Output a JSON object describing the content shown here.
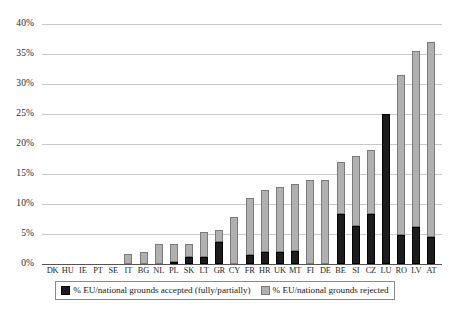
{
  "chart_data": {
    "type": "bar",
    "stacked": true,
    "title": "",
    "subtitle": "",
    "xlabel": "",
    "ylabel": "",
    "ylim": [
      0,
      40
    ],
    "ytick_step": 5,
    "ytick_labels": [
      "0%",
      "5%",
      "10%",
      "15%",
      "20%",
      "25%",
      "30%",
      "35%",
      "40%"
    ],
    "ytick_values": [
      0,
      5,
      10,
      15,
      20,
      25,
      30,
      35,
      40
    ],
    "grid": true,
    "legend_position": "bottom",
    "categories": [
      "DK",
      "HU",
      "IE",
      "PT",
      "SE",
      "IT",
      "BG",
      "NL",
      "PL",
      "SK",
      "LT",
      "GR",
      "CY",
      "FR",
      "HR",
      "UK",
      "MT",
      "FI",
      "DE",
      "BE",
      "SI",
      "CZ",
      "LU",
      "RO",
      "LV",
      "AT"
    ],
    "series": [
      {
        "name": "% EU/national grounds accepted (fully/partially)",
        "color": "#1c1c1c",
        "values": [
          0,
          0,
          0,
          0,
          0,
          0,
          0,
          0,
          0.4,
          1.1,
          1.2,
          3.7,
          0,
          1.5,
          2.0,
          2.0,
          2.1,
          0,
          0,
          8.3,
          6.3,
          8.3,
          25.0,
          4.8,
          6.2,
          4.5
        ]
      },
      {
        "name": "% EU/national grounds rejected",
        "color": "#b0b0b0",
        "values": [
          0,
          0,
          0,
          0,
          0,
          1.7,
          2.0,
          3.3,
          2.9,
          2.3,
          4.2,
          2.0,
          7.8,
          9.5,
          10.4,
          10.8,
          11.2,
          14.0,
          14.0,
          8.7,
          11.7,
          10.7,
          0,
          26.7,
          29.3,
          32.5
        ]
      }
    ],
    "totals": [
      0,
      0,
      0,
      0,
      0,
      1.7,
      2.0,
      3.3,
      3.3,
      3.4,
      5.4,
      5.7,
      7.8,
      11.0,
      12.4,
      12.8,
      13.3,
      14.0,
      14.0,
      17.0,
      18.0,
      19.0,
      25.0,
      31.5,
      35.5,
      37.0
    ]
  },
  "legend": {
    "entries": [
      {
        "label": "% EU/national grounds accepted (fully/partially)",
        "swatch": "accepted"
      },
      {
        "label": "% EU/national grounds rejected",
        "swatch": "rejected"
      }
    ]
  }
}
